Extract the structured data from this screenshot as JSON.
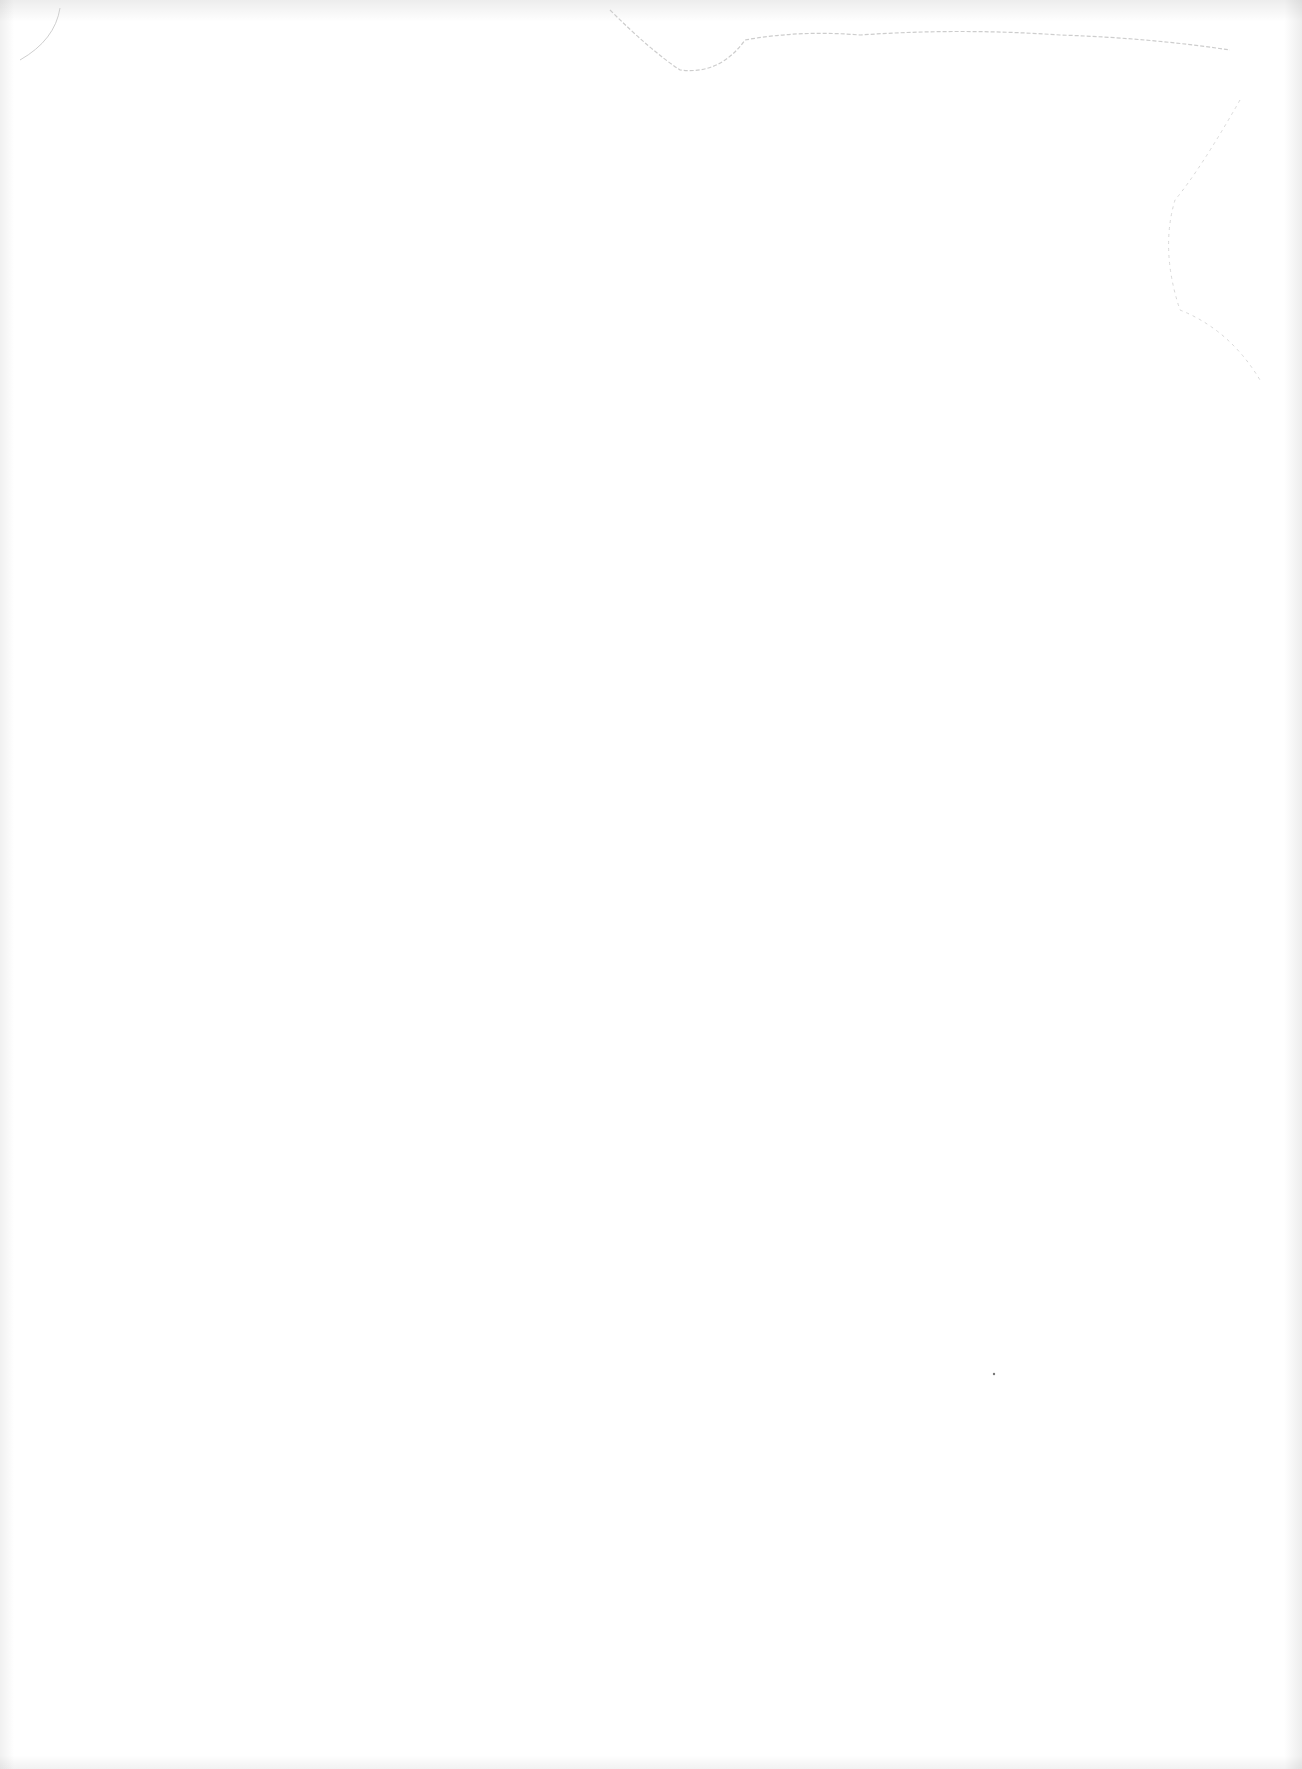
{
  "document": {
    "kind": "blank scanned page",
    "text_content": ""
  }
}
